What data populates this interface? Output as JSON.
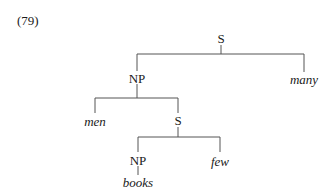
{
  "example_number": "(79)",
  "tree": {
    "root": {
      "label": "S"
    },
    "np1": {
      "label": "NP"
    },
    "many": {
      "label": "many"
    },
    "men": {
      "label": "men"
    },
    "s2": {
      "label": "S"
    },
    "np2": {
      "label": "NP"
    },
    "few": {
      "label": "few"
    },
    "books": {
      "label": "books"
    }
  }
}
